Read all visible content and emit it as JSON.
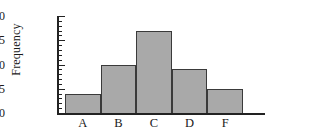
{
  "chart_data": {
    "type": "bar",
    "title": "",
    "subtitle": "",
    "xlabel": "",
    "ylabel": "Frequency",
    "categories": [
      "A",
      "B",
      "C",
      "D",
      "F"
    ],
    "values": [
      4,
      10,
      17,
      9,
      5
    ],
    "ylim": [
      0,
      20
    ],
    "ytick_labels": [
      "0",
      "5",
      "10",
      "15",
      "20"
    ],
    "ytick_values": [
      0,
      5,
      10,
      15,
      20
    ],
    "ytick_minor_step": 1,
    "grid": false,
    "legend": null,
    "bar_fill_color": "#a9a9a9",
    "bar_edge_color": "#3a3a3a",
    "axis_color": "#222222",
    "background_color": "#ffffff",
    "annotations": []
  }
}
